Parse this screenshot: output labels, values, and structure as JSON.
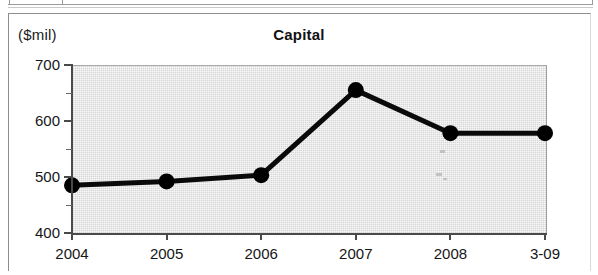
{
  "figure": {
    "title": "Capital",
    "y_unit_label": "($mil)"
  },
  "chart_data": {
    "type": "line",
    "title": "Capital",
    "xlabel": "",
    "ylabel": "($mil)",
    "ylim": [
      400,
      700
    ],
    "y_major_ticks": [
      400,
      500,
      600,
      700
    ],
    "y_minor_ticks": [
      450,
      550,
      650
    ],
    "grid": false,
    "legend": "none",
    "categories": [
      "2004",
      "2005",
      "2006",
      "2007",
      "2008",
      "3-09"
    ],
    "series": [
      {
        "name": "Capital",
        "color": "#000000",
        "marker": "circle",
        "values": [
          487,
          494,
          505,
          657,
          580,
          580
        ]
      }
    ]
  },
  "axis": {
    "y_tick_labels": [
      "700",
      "600",
      "500",
      "400"
    ],
    "x_tick_labels": [
      "2004",
      "2005",
      "2006",
      "2007",
      "2008",
      "3-09"
    ]
  }
}
